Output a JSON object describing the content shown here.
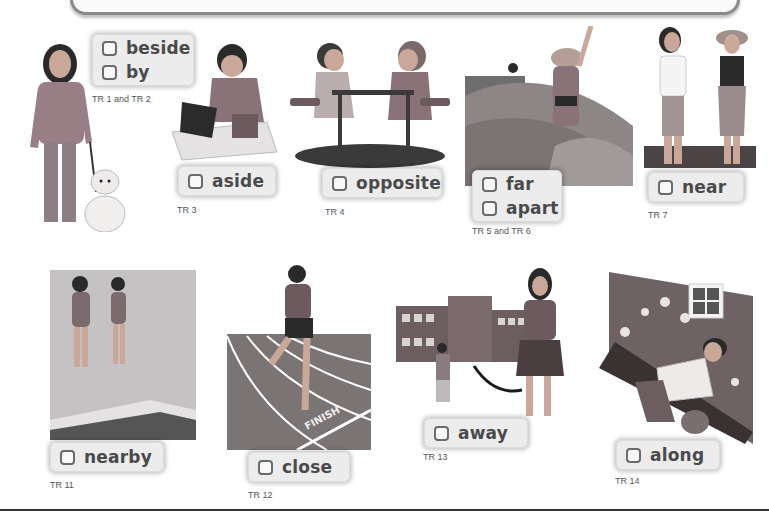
{
  "theme": {
    "label_bg": "#ececec",
    "checkbox_border": "#6b6b6b",
    "word_color": "#4a4a4a",
    "track_text_color": "#555555"
  },
  "items": [
    {
      "id": "beside-by",
      "words": [
        "beside",
        "by"
      ],
      "track": "TR 1 and TR 2",
      "scene": "girl walking dog"
    },
    {
      "id": "aside",
      "words": [
        "aside"
      ],
      "track": "TR 3",
      "scene": "boy putting laptop aside on desk"
    },
    {
      "id": "opposite",
      "words": [
        "opposite"
      ],
      "track": "TR 4",
      "scene": "two girls sitting opposite at table"
    },
    {
      "id": "far-apart",
      "words": [
        "far",
        "apart"
      ],
      "track": "TR 5 and TR 6",
      "scene": "girl waving on rocks to distant friend"
    },
    {
      "id": "near",
      "words": [
        "near"
      ],
      "track": "TR 7",
      "scene": "two girls standing near each other"
    },
    {
      "id": "nearby",
      "words": [
        "nearby"
      ],
      "track": "TR 11",
      "scene": "two girls near swimming pool"
    },
    {
      "id": "close",
      "words": [
        "close"
      ],
      "track": "TR 12",
      "scene": "runner close to finish line"
    },
    {
      "id": "away",
      "words": [
        "away"
      ],
      "track": "TR 13",
      "scene": "girl walking away from school"
    },
    {
      "id": "along",
      "words": [
        "along"
      ],
      "track": "TR 14",
      "scene": "boy gardening along flower bed"
    }
  ],
  "track_finish_text": "FINISH"
}
